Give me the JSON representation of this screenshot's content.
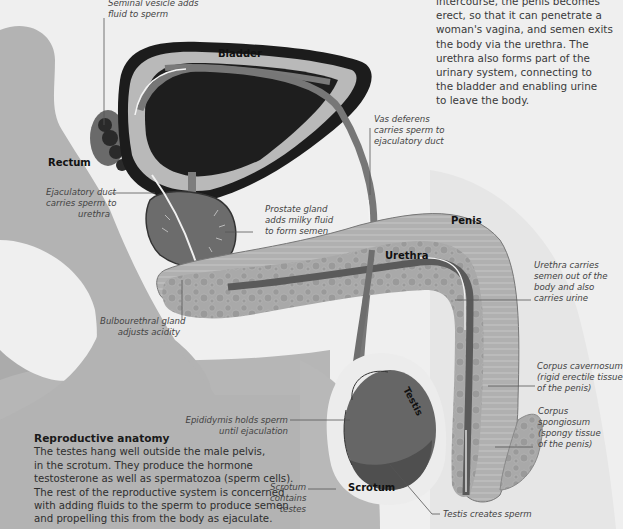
{
  "intro_text": {
    "lines": [
      "intercourse, the penis becomes",
      "erect, so that it can penetrate a",
      "woman's vagina, and semen exits",
      "the body via the urethra. The",
      "urethra also forms part of the",
      "urinary system, connecting to",
      "the bladder and enabling urine",
      "to leave the body."
    ]
  },
  "structure_labels": {
    "bladder": "Bladder",
    "rectum": "Rectum",
    "penis": "Penis",
    "urethra": "Urethra",
    "testis": "Testis",
    "scrotum": "Scrotum"
  },
  "callouts": {
    "seminal_vesicle": [
      "Seminal vesicle adds",
      "fluid to sperm"
    ],
    "vas_deferens": [
      "Vas deferens",
      "carries sperm to",
      "ejaculatory duct"
    ],
    "ejaculatory_duct": [
      "Ejaculatory duct",
      "carries sperm to",
      "urethra"
    ],
    "prostate": [
      "Prostate gland",
      "adds milky fluid",
      "to form semen"
    ],
    "bulbourethral": [
      "Bulbourethral gland",
      "adjusts acidity"
    ],
    "urethra_desc": [
      "Urethra carries",
      "semen out of the",
      "body and also",
      "carries urine"
    ],
    "corpus_cavernosum": [
      "Corpus cavernosum",
      "(rigid erectile tissue",
      "of the penis)"
    ],
    "corpus_spongiosum": [
      "Corpus",
      "spongiosum",
      "(spongy tissue",
      "of the penis)"
    ],
    "epididymis": [
      "Epididymis holds sperm",
      "until ejaculation"
    ],
    "scrotum_desc": [
      "Scrotum",
      "contains",
      "testes"
    ],
    "testis_desc": [
      "Testis creates sperm"
    ]
  },
  "info_box": {
    "title": "Reproductive anatomy",
    "lines": [
      "The testes hang well outside the male pelvis,",
      "in the scrotum. They produce the hormone",
      "testosterone as well as spermatozoa (sperm cells).",
      "The rest of the reproductive system is concerned",
      "with adding fluids to the sperm to produce semen",
      "and propelling this from the body as ejaculate."
    ]
  },
  "colors": {
    "page_bg": "#efefef",
    "body_gray": "#b4b4b4",
    "body_dark": "#a2a2a2",
    "organ_dark": "#1e1e1e",
    "gland_mid": "#6a6a6a",
    "tissue_light": "#9c9c9c",
    "outline": "#444444"
  }
}
